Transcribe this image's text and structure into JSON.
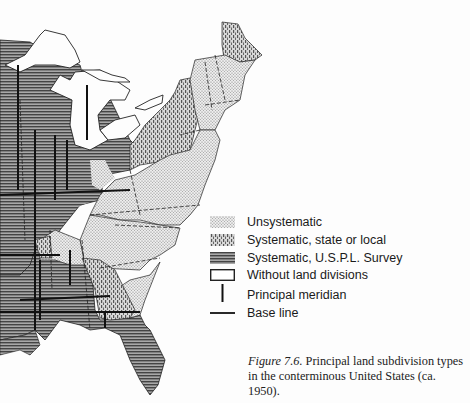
{
  "figure": {
    "label": "Figure 7.6.",
    "caption": " Principal land subdivision types in the conterminous United States (ca. 1950)."
  },
  "legend": {
    "items": [
      {
        "key": "unsystematic",
        "label": "Unsystematic",
        "pattern": "fine-dots"
      },
      {
        "key": "systematic-state",
        "label": "Systematic, state or local",
        "pattern": "coarse-dashes"
      },
      {
        "key": "systematic-uspl",
        "label": "Systematic, U.S.P.L. Survey",
        "pattern": "horizontal-lines"
      },
      {
        "key": "none",
        "label": "Without land divisions",
        "pattern": "empty-box"
      },
      {
        "key": "meridian",
        "label": "Principal meridian",
        "pattern": "vertical-line"
      },
      {
        "key": "baseline",
        "label": "Base line",
        "pattern": "horizontal-line"
      }
    ]
  },
  "colors": {
    "uspl_fill": "#8a8a8a",
    "unsystematic_fill": "#dcdcdc",
    "state_fill": "#b4b4b4",
    "border": "#222222",
    "background": "#fdfdfd"
  }
}
